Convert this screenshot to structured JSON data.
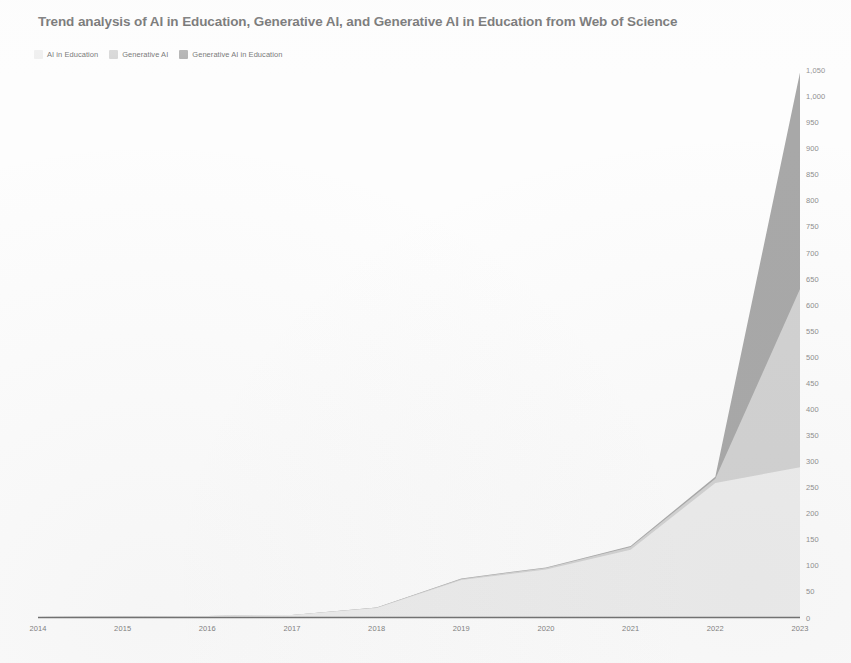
{
  "chart_data": {
    "type": "area",
    "stacked": true,
    "title": "Trend analysis of AI in Education, Generative AI, and Generative AI in Education from Web of Science",
    "xlabel": "",
    "ylabel": "",
    "categories": [
      "2014",
      "2015",
      "2016",
      "2017",
      "2018",
      "2019",
      "2020",
      "2021",
      "2022",
      "2023"
    ],
    "x": [
      2014,
      2015,
      2016,
      2017,
      2018,
      2019,
      2020,
      2021,
      2022,
      2023
    ],
    "series": [
      {
        "name": "AI in Education",
        "color": "#ededed",
        "values": [
          1,
          2,
          3,
          5,
          18,
          72,
          92,
          130,
          258,
          288
        ]
      },
      {
        "name": "Generative AI",
        "color": "#d2d2d2",
        "values": [
          0,
          0,
          0,
          0,
          1,
          2,
          3,
          5,
          8,
          342
        ]
      },
      {
        "name": "Generative AI in Education",
        "color": "#a8a8a8",
        "values": [
          0,
          0,
          0,
          0,
          0,
          1,
          1,
          2,
          4,
          415
        ]
      }
    ],
    "cumulative_tops": [
      1,
      2,
      3,
      5,
      19,
      75,
      96,
      137,
      270,
      1045
    ],
    "ylim": [
      0,
      1050
    ],
    "y_ticks": [
      0,
      50,
      100,
      150,
      200,
      250,
      300,
      350,
      400,
      450,
      500,
      550,
      600,
      650,
      700,
      750,
      800,
      850,
      900,
      950,
      1000,
      1050
    ],
    "y_tick_labels": [
      "0",
      "50",
      "100",
      "150",
      "200",
      "250",
      "300",
      "350",
      "400",
      "450",
      "500",
      "550",
      "600",
      "650",
      "700",
      "750",
      "800",
      "850",
      "900",
      "950",
      "1,000",
      "1,050"
    ],
    "y_axis_position": "right",
    "grid": false,
    "legend_position": "top-left",
    "x_axis_line_color": "#6f6f6f",
    "background": "#fdfdfd"
  },
  "legend": {
    "items": [
      {
        "label": "AI in Education",
        "color": "#ededed"
      },
      {
        "label": "Generative AI",
        "color": "#d2d2d2"
      },
      {
        "label": "Generative AI in Education",
        "color": "#a8a8a8"
      }
    ]
  }
}
